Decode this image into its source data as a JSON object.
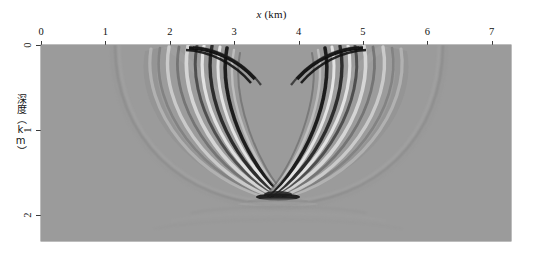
{
  "figure": {
    "x_axis_title": "x (km)",
    "x_axis_title_symbol": "x",
    "x_axis_title_unit": " (km)",
    "y_axis_title": "深度（km）"
  },
  "chart_data": {
    "type": "heatmap",
    "title": "",
    "subtitle": "",
    "xlabel": "x (km)",
    "ylabel": "深度（km）",
    "xlim": [
      0,
      7.3
    ],
    "ylim": [
      0,
      2.3
    ],
    "y_axis_direction": "inverted",
    "grid": false,
    "legend": "none",
    "colormap": "grayscale",
    "background_value_color": "#9b9b9b",
    "xticks": [
      0,
      1,
      2,
      3,
      4,
      5,
      6,
      7
    ],
    "xticklabels": [
      "0",
      "1",
      "2",
      "3",
      "4",
      "5",
      "6",
      "7"
    ],
    "yticks": [
      0,
      1,
      2
    ],
    "yticklabels": [
      "0",
      "1",
      "2"
    ],
    "features": [
      {
        "name": "left-lobe",
        "apex_top_x": 1.72,
        "apex_top_y": 0.04,
        "cusp_x": 3.6,
        "cusp_y": 1.77
      },
      {
        "name": "right-lobe",
        "apex_top_x": 6.28,
        "apex_top_y": 0.04,
        "cusp_x": 3.6,
        "cusp_y": 1.77
      },
      {
        "name": "outer-faint-arc-left",
        "surface_intercept_x": 1.15,
        "max_depth_y": 2.1
      },
      {
        "name": "outer-faint-arc-right",
        "surface_intercept_x": 6.9,
        "max_depth_y": 2.1
      }
    ],
    "amplitude_extremes": {
      "min_color": "#141414",
      "max_color": "#f0f0f0",
      "zero_color": "#9b9b9b"
    }
  }
}
